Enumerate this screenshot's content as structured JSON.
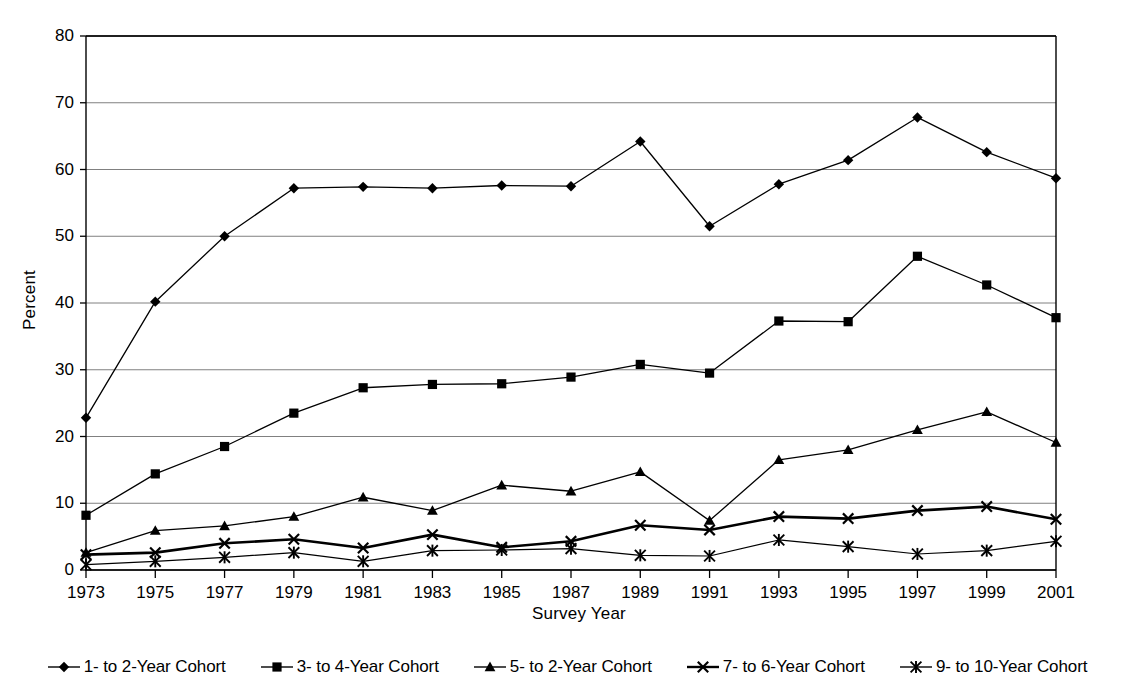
{
  "chart_data": {
    "type": "line",
    "title": "",
    "xlabel": "Survey Year",
    "ylabel": "Percent",
    "ylim": [
      0,
      80
    ],
    "ytick_step": 10,
    "grid": true,
    "legend_position": "bottom",
    "marker_color": "#000000",
    "line_color": "#000000",
    "grid_color": "#808080",
    "axis_color": "#000000",
    "categories": [
      "1973",
      "1975",
      "1977",
      "1979",
      "1981",
      "1983",
      "1985",
      "1987",
      "1989",
      "1991",
      "1993",
      "1995",
      "1997",
      "1999",
      "2001"
    ],
    "yticks": [
      "0",
      "10",
      "20",
      "30",
      "40",
      "50",
      "60",
      "70",
      "80"
    ],
    "series": [
      {
        "name": "1- to 2-Year Cohort",
        "marker": "diamond",
        "line_width": 1.3,
        "values": [
          22.8,
          40.2,
          50.0,
          57.2,
          57.4,
          57.2,
          57.6,
          57.5,
          64.2,
          51.5,
          57.8,
          61.4,
          67.8,
          62.6,
          58.7
        ]
      },
      {
        "name": "3- to 4-Year Cohort",
        "marker": "square",
        "line_width": 1.3,
        "values": [
          8.2,
          14.4,
          18.5,
          23.5,
          27.3,
          27.8,
          27.9,
          28.9,
          30.8,
          29.5,
          37.3,
          37.2,
          47.0,
          42.7,
          37.8
        ]
      },
      {
        "name": "5- to 2-Year Cohort",
        "marker": "triangle",
        "line_width": 1.3,
        "values": [
          2.6,
          5.9,
          6.6,
          8.0,
          10.9,
          8.9,
          12.7,
          11.8,
          14.7,
          7.4,
          16.5,
          18.0,
          21.0,
          23.7,
          19.1
        ]
      },
      {
        "name": "7- to 6-Year Cohort",
        "marker": "x",
        "line_width": 2.6,
        "values": [
          2.3,
          2.6,
          4.0,
          4.6,
          3.3,
          5.3,
          3.4,
          4.3,
          6.7,
          6.0,
          8.0,
          7.7,
          8.9,
          9.5,
          7.6
        ]
      },
      {
        "name": "9- to 10-Year Cohort",
        "marker": "asterisk",
        "line_width": 1.2,
        "values": [
          0.8,
          1.3,
          1.9,
          2.6,
          1.3,
          2.9,
          3.0,
          3.2,
          2.2,
          2.1,
          4.5,
          3.5,
          2.4,
          2.9,
          4.3
        ]
      }
    ]
  },
  "legend": {
    "items": [
      {
        "label": "1- to 2-Year Cohort",
        "marker": "diamond"
      },
      {
        "label": "3- to 4-Year Cohort",
        "marker": "square"
      },
      {
        "label": "5- to 2-Year Cohort",
        "marker": "triangle"
      },
      {
        "label": "7- to 6-Year Cohort",
        "marker": "x"
      },
      {
        "label": "9- to 10-Year Cohort",
        "marker": "asterisk"
      }
    ]
  }
}
